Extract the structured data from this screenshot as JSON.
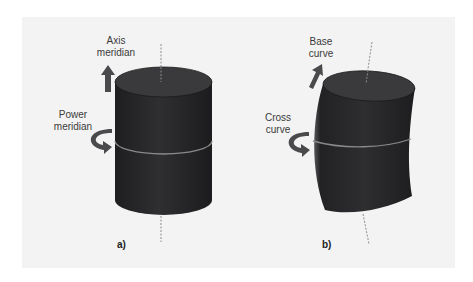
{
  "figure": {
    "panel_a": {
      "label": "a)",
      "axis_label": "Axis\nmeridian",
      "power_label": "Power\nmeridian"
    },
    "panel_b": {
      "label": "b)",
      "base_label": "Base\ncurve",
      "cross_label": "Cross\ncurve"
    }
  },
  "colors": {
    "background": "#f3f3f3",
    "cylinder_body": "#2b2b2d",
    "cylinder_top": "#3a3a3c",
    "band": "#8a8a8a",
    "arrow": "#4a4a4c",
    "axis_line": "#8c8c8c"
  }
}
